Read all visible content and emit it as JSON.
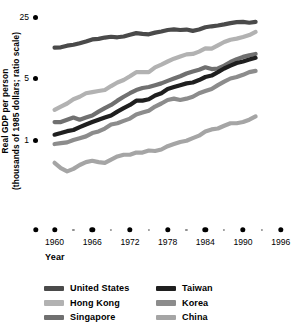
{
  "chart_data": {
    "type": "line",
    "title": "",
    "xlabel": "Year",
    "ylabel": "Real GDP per person (thousands of 1985 dollars; ratio scale)",
    "ylabel_lines": [
      "Real GDP per person",
      "(thousands of 1985 dollars; ratio scale)"
    ],
    "scale": "log",
    "grid": false,
    "legend_position": "bottom",
    "xlim": [
      1958,
      1997
    ],
    "ylim": [
      0.35,
      30
    ],
    "yticks": [
      {
        "value": 25,
        "label": "25"
      },
      {
        "value": 5,
        "label": "5"
      },
      {
        "value": 1,
        "label": "1"
      }
    ],
    "xticks_major": [
      "1960",
      "1966",
      "1972",
      "1978",
      "1984",
      "1990",
      "1996"
    ],
    "xtick_values_major": [
      1960,
      1966,
      1972,
      1978,
      1984,
      1990,
      1996
    ],
    "xtick_dots_big": [
      1957,
      1960,
      1966,
      1972,
      1978,
      1984,
      1990,
      1996
    ],
    "xtick_dots_small": [
      1963,
      1969,
      1975,
      1981,
      1987,
      1993
    ],
    "x": [
      1960,
      1961,
      1962,
      1963,
      1964,
      1965,
      1966,
      1967,
      1968,
      1969,
      1970,
      1971,
      1972,
      1973,
      1974,
      1975,
      1976,
      1977,
      1978,
      1979,
      1980,
      1981,
      1982,
      1983,
      1984,
      1985,
      1986,
      1987,
      1988,
      1989,
      1990,
      1991,
      1992
    ],
    "series": [
      {
        "name": "United States",
        "color": "#4a4a4a",
        "values": [
          11.2,
          11.3,
          11.8,
          12.1,
          12.6,
          13.2,
          13.9,
          14.1,
          14.6,
          14.9,
          14.7,
          15.0,
          15.7,
          16.4,
          16.1,
          15.9,
          16.6,
          17.1,
          17.8,
          18.1,
          17.8,
          18.0,
          17.4,
          18.0,
          19.1,
          19.6,
          20.0,
          20.6,
          21.3,
          21.9,
          22.0,
          21.5,
          22.0
        ]
      },
      {
        "name": "Hong Kong",
        "color": "#b2b2b2",
        "values": [
          2.2,
          2.4,
          2.6,
          2.9,
          3.1,
          3.4,
          3.5,
          3.6,
          3.7,
          4.1,
          4.5,
          4.8,
          5.3,
          5.9,
          5.9,
          5.9,
          6.7,
          7.2,
          7.8,
          8.4,
          8.9,
          9.4,
          9.5,
          10.1,
          11.0,
          10.9,
          11.9,
          13.0,
          13.8,
          14.2,
          14.8,
          15.6,
          16.9
        ]
      },
      {
        "name": "Singapore",
        "color": "#707070",
        "values": [
          1.6,
          1.6,
          1.7,
          1.8,
          1.7,
          1.8,
          1.9,
          2.1,
          2.3,
          2.5,
          2.8,
          3.1,
          3.4,
          3.7,
          3.9,
          4.0,
          4.2,
          4.4,
          4.7,
          5.0,
          5.3,
          5.7,
          6.0,
          6.3,
          6.7,
          6.4,
          6.5,
          7.0,
          7.7,
          8.3,
          8.8,
          9.2,
          9.5
        ]
      },
      {
        "name": "Taiwan",
        "color": "#1f1f1f",
        "values": [
          1.15,
          1.2,
          1.26,
          1.3,
          1.4,
          1.5,
          1.6,
          1.7,
          1.8,
          1.9,
          2.1,
          2.3,
          2.5,
          2.8,
          2.8,
          2.9,
          3.2,
          3.4,
          3.8,
          4.0,
          4.2,
          4.4,
          4.5,
          4.8,
          5.2,
          5.4,
          5.9,
          6.5,
          7.0,
          7.5,
          7.8,
          8.2,
          8.6
        ]
      },
      {
        "name": "Korea",
        "color": "#8c8c8c",
        "values": [
          0.9,
          0.92,
          0.94,
          1.0,
          1.05,
          1.1,
          1.2,
          1.25,
          1.35,
          1.5,
          1.55,
          1.65,
          1.75,
          1.95,
          2.05,
          2.15,
          2.4,
          2.6,
          2.85,
          2.95,
          2.85,
          2.95,
          3.1,
          3.4,
          3.6,
          3.8,
          4.2,
          4.6,
          5.0,
          5.2,
          5.5,
          5.9,
          6.1
        ]
      },
      {
        "name": "China",
        "color": "#a5a5a5",
        "values": [
          0.55,
          0.48,
          0.44,
          0.47,
          0.52,
          0.56,
          0.58,
          0.56,
          0.55,
          0.6,
          0.65,
          0.68,
          0.68,
          0.72,
          0.72,
          0.76,
          0.75,
          0.78,
          0.85,
          0.9,
          0.95,
          0.98,
          1.05,
          1.12,
          1.25,
          1.32,
          1.35,
          1.45,
          1.55,
          1.55,
          1.6,
          1.7,
          1.85
        ]
      }
    ]
  },
  "legend": {
    "column_left": [
      {
        "label": "United States",
        "color": "#4a4a4a"
      },
      {
        "label": "Hong Kong",
        "color": "#b2b2b2"
      },
      {
        "label": "Singapore",
        "color": "#707070"
      }
    ],
    "column_right": [
      {
        "label": "Taiwan",
        "color": "#1f1f1f"
      },
      {
        "label": "Korea",
        "color": "#8c8c8c"
      },
      {
        "label": "China",
        "color": "#a5a5a5"
      }
    ]
  }
}
